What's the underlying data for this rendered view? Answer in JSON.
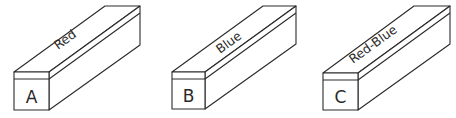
{
  "diagram": {
    "colors": {
      "stroke": "#2a2a2a",
      "background": "#ffffff"
    },
    "bars": [
      {
        "id": "A",
        "front_label": "A",
        "top_label": "Red"
      },
      {
        "id": "B",
        "front_label": "B",
        "top_label": "Blue"
      },
      {
        "id": "C",
        "front_label": "C",
        "top_label": "Red-Blue"
      }
    ]
  }
}
